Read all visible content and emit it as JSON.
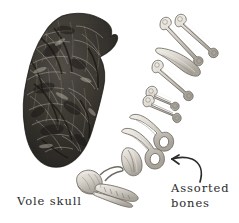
{
  "figure": {
    "background_color": "#ffffff",
    "width": 239,
    "height": 223,
    "ink_color": "#2b2b2b",
    "bone_color": "#cfcbc4",
    "bone_outline_color": "#6e6a63",
    "pellet_color": "#2e2b27"
  },
  "captions": {
    "vole_skull": "Vole skull",
    "assorted_bones_line1": "Assorted",
    "assorted_bones_line2": "bones"
  },
  "annotations": {
    "arrow": {
      "name": "curved-arrow",
      "direction": "up-left",
      "points_to": "assorted bones"
    }
  },
  "specimens": [
    {
      "name": "owl-pellet",
      "label": "",
      "kind": "pellet"
    },
    {
      "name": "vole-skull",
      "label": "Vole skull",
      "kind": "skull"
    },
    {
      "name": "long-bone-1",
      "label": "",
      "kind": "long-bone"
    },
    {
      "name": "long-bone-2",
      "label": "",
      "kind": "long-bone"
    },
    {
      "name": "long-bone-3",
      "label": "",
      "kind": "long-bone"
    },
    {
      "name": "long-bone-4",
      "label": "",
      "kind": "long-bone"
    },
    {
      "name": "rib-bone",
      "label": "",
      "kind": "rib"
    },
    {
      "name": "humerus-1",
      "label": "",
      "kind": "humerus"
    },
    {
      "name": "humerus-2",
      "label": "",
      "kind": "humerus"
    },
    {
      "name": "pelvis-1",
      "label": "",
      "kind": "pelvis"
    },
    {
      "name": "pelvis-2",
      "label": "",
      "kind": "pelvis"
    },
    {
      "name": "scapula",
      "label": "",
      "kind": "scapula"
    }
  ]
}
